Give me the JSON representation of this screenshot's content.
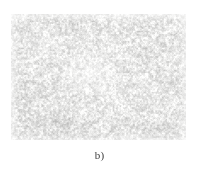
{
  "figure": {
    "panel_label": "b)",
    "caption_color": "#3d3d3d",
    "page_background": "#ffffff",
    "image": {
      "kind": "micrograph",
      "alt_name": "grayscale-microstructure-micrograph",
      "description": "Fine-grained mottled grayscale micrograph",
      "x": 11,
      "y": 14,
      "width": 175,
      "height": 126,
      "base_tone": "#f2f2f0",
      "grain_dark": "#8a8a8a",
      "grain_mid": "#c2c2c0",
      "grain_light": "#fbfbfa",
      "mean_gray_level": 228,
      "grain_scale_px": 1.6,
      "contrast": 0.42,
      "brighter_region": "center-left",
      "denser_region": "lower-left"
    }
  },
  "chart_data": {
    "type": "heatmap",
    "title": "b)",
    "xlabel": "",
    "ylabel": "",
    "grid": false,
    "legend": "none",
    "value_range": [
      120,
      255
    ],
    "colormap": "grayscale"
  }
}
